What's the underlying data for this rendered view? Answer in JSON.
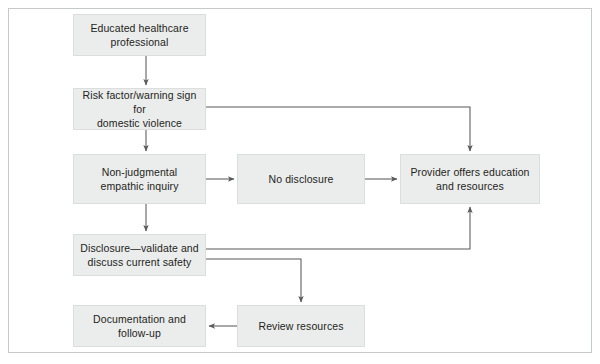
{
  "figure": {
    "type": "flowchart",
    "frame_color": "#c6c9cb",
    "node_fill": "#ebecec",
    "node_border": "#dcdddd",
    "connector_color": "#58595b",
    "text_color": "#231f20"
  },
  "nodes": [
    {
      "id": "educated-professional",
      "label": "Educated healthcare professional",
      "lines": [
        "Educated healthcare",
        "professional"
      ],
      "x": 73,
      "y": 14,
      "w": 133,
      "h": 42
    },
    {
      "id": "risk-factor",
      "label": "Risk factor/warning sign for domestic violence",
      "lines": [
        "Risk factor/warning sign for",
        "domestic violence"
      ],
      "x": 73,
      "y": 88,
      "w": 133,
      "h": 42
    },
    {
      "id": "empathic-inquiry",
      "label": "Non-judgmental empathic inquiry",
      "lines": [
        "Non-judgmental",
        "empathic inquiry"
      ],
      "x": 73,
      "y": 154,
      "w": 133,
      "h": 50
    },
    {
      "id": "no-disclosure",
      "label": "No disclosure",
      "lines": [
        "No disclosure"
      ],
      "x": 237,
      "y": 154,
      "w": 128,
      "h": 50
    },
    {
      "id": "provider-offers",
      "label": "Provider offers education and resources",
      "lines": [
        "Provider offers education",
        "and resources"
      ],
      "x": 400,
      "y": 154,
      "w": 140,
      "h": 50
    },
    {
      "id": "disclosure-validate",
      "label": "Disclosure—validate and discuss current safety",
      "lines": [
        "Disclosure—validate and",
        "discuss current safety"
      ],
      "x": 73,
      "y": 234,
      "w": 133,
      "h": 42
    },
    {
      "id": "review-resources",
      "label": "Review resources",
      "lines": [
        "Review resources"
      ],
      "x": 237,
      "y": 305,
      "w": 128,
      "h": 42
    },
    {
      "id": "documentation-followup",
      "label": "Documentation and follow-up",
      "lines": [
        "Documentation and follow-up"
      ],
      "x": 73,
      "y": 305,
      "w": 133,
      "h": 42
    }
  ],
  "connectors": [
    {
      "id": "educated-to-risk",
      "from": "educated-professional",
      "to": "risk-factor",
      "kind": "vertical-arrow"
    },
    {
      "id": "risk-to-inquiry",
      "from": "risk-factor",
      "to": "empathic-inquiry",
      "kind": "vertical-arrow"
    },
    {
      "id": "risk-to-provider",
      "from": "risk-factor",
      "to": "provider-offers",
      "kind": "right-down-arrow"
    },
    {
      "id": "inquiry-to-no-disclosure",
      "from": "empathic-inquiry",
      "to": "no-disclosure",
      "kind": "horizontal-arrow"
    },
    {
      "id": "no-disclosure-to-provider",
      "from": "no-disclosure",
      "to": "provider-offers",
      "kind": "horizontal-arrow"
    },
    {
      "id": "inquiry-to-disclosure",
      "from": "empathic-inquiry",
      "to": "disclosure-validate",
      "kind": "vertical-arrow"
    },
    {
      "id": "disclosure-to-provider",
      "from": "disclosure-validate",
      "to": "provider-offers",
      "kind": "right-up-arrow"
    },
    {
      "id": "disclosure-to-review",
      "from": "disclosure-validate",
      "to": "review-resources",
      "kind": "right-down-arrow"
    },
    {
      "id": "review-to-documentation",
      "from": "review-resources",
      "to": "documentation-followup",
      "kind": "horizontal-arrow"
    }
  ]
}
